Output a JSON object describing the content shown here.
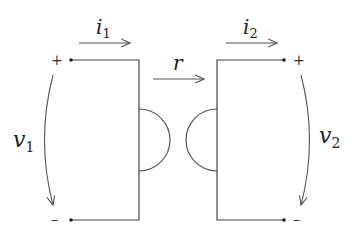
{
  "diagram": {
    "type": "two-port gyrator",
    "labels": {
      "i1": {
        "main": "i",
        "sub": "1"
      },
      "i2": {
        "main": "i",
        "sub": "2"
      },
      "r": "r",
      "v1": {
        "main": "v",
        "sub": "1"
      },
      "v2": {
        "main": "v",
        "sub": "2"
      }
    },
    "polarity": {
      "left_top": "+",
      "left_bottom": "–",
      "right_top": "+",
      "right_bottom": "–"
    },
    "colors": {
      "stroke": "#444444",
      "text": "#222222",
      "background": "#ffffff"
    }
  }
}
